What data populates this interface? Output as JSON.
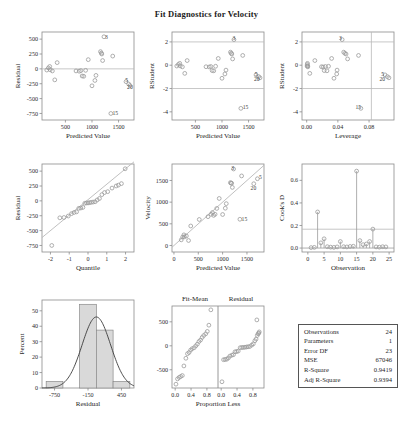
{
  "title": "Fit Diagnostics for Velocity",
  "colors": {
    "marker": "#9a9a9a",
    "axis": "#8c8c8c",
    "refline": "#b9b9b9",
    "curve": "#3b3b3b",
    "bar_fill": "#d9d9d9",
    "bar_edge": "#8a8a8a",
    "text": "#242424",
    "background": "#ffffff"
  },
  "chart_data": [
    {
      "id": "residual-vs-predicted",
      "type": "scatter",
      "title": "",
      "xlabel": "Predicted Value",
      "ylabel": "Residual",
      "xlim": [
        60,
        1790
      ],
      "ylim": [
        -860,
        620
      ],
      "xticks": [
        500,
        1000,
        1500
      ],
      "yticks": [
        -750,
        -500,
        -250,
        0,
        250,
        500
      ],
      "grid": false,
      "hline": 0,
      "points": [
        {
          "x": 150,
          "y": -20
        },
        {
          "x": 180,
          "y": 15
        },
        {
          "x": 205,
          "y": 40
        },
        {
          "x": 215,
          "y": -15
        },
        {
          "x": 255,
          "y": -35
        },
        {
          "x": 300,
          "y": -185
        },
        {
          "x": 345,
          "y": 105
        },
        {
          "x": 700,
          "y": -35
        },
        {
          "x": 760,
          "y": -40
        },
        {
          "x": 790,
          "y": -30
        },
        {
          "x": 815,
          "y": -120
        },
        {
          "x": 845,
          "y": -125
        },
        {
          "x": 880,
          "y": -25
        },
        {
          "x": 930,
          "y": 155
        },
        {
          "x": 1000,
          "y": -285
        },
        {
          "x": 1055,
          "y": -195
        },
        {
          "x": 1075,
          "y": -110
        },
        {
          "x": 1160,
          "y": 290
        },
        {
          "x": 1175,
          "y": 265
        },
        {
          "x": 1185,
          "y": 250
        },
        {
          "x": 1200,
          "y": 140
        },
        {
          "x": 1225,
          "y": 540
        },
        {
          "x": 1355,
          "y": -750
        },
        {
          "x": 1390,
          "y": 215
        },
        {
          "x": 1640,
          "y": -215
        },
        {
          "x": 1690,
          "y": -255
        },
        {
          "x": 1715,
          "y": -280
        }
      ],
      "labels": [
        {
          "x": 1245,
          "y": 540,
          "text": "3"
        },
        {
          "x": 1385,
          "y": -750,
          "text": "15"
        },
        {
          "x": 1625,
          "y": -185,
          "text": "5"
        },
        {
          "x": 1660,
          "y": -310,
          "text": "20"
        }
      ]
    },
    {
      "id": "rstudent-vs-predicted",
      "type": "scatter",
      "title": "",
      "xlabel": "Predicted Value",
      "ylabel": "RStudent",
      "xlim": [
        60,
        1790
      ],
      "ylim": [
        -4.7,
        2.85
      ],
      "xticks": [
        500,
        1000,
        1500
      ],
      "yticks": [
        -4,
        -2,
        0,
        2
      ],
      "grid": false,
      "hlines": [
        -2,
        2
      ],
      "points": [
        {
          "x": 150,
          "y": -0.07
        },
        {
          "x": 180,
          "y": 0.06
        },
        {
          "x": 205,
          "y": 0.16
        },
        {
          "x": 215,
          "y": -0.06
        },
        {
          "x": 255,
          "y": -0.14
        },
        {
          "x": 300,
          "y": -0.7
        },
        {
          "x": 345,
          "y": 0.4
        },
        {
          "x": 700,
          "y": -0.13
        },
        {
          "x": 760,
          "y": -0.15
        },
        {
          "x": 790,
          "y": -0.11
        },
        {
          "x": 815,
          "y": -0.46
        },
        {
          "x": 845,
          "y": -0.48
        },
        {
          "x": 880,
          "y": -0.09
        },
        {
          "x": 930,
          "y": 0.58
        },
        {
          "x": 1000,
          "y": -1.12
        },
        {
          "x": 1055,
          "y": -0.75
        },
        {
          "x": 1075,
          "y": -0.42
        },
        {
          "x": 1160,
          "y": 1.12
        },
        {
          "x": 1175,
          "y": 1.02
        },
        {
          "x": 1185,
          "y": 0.96
        },
        {
          "x": 1200,
          "y": 0.54
        },
        {
          "x": 1225,
          "y": 2.2
        },
        {
          "x": 1355,
          "y": -3.7
        },
        {
          "x": 1390,
          "y": 0.84
        },
        {
          "x": 1640,
          "y": -0.83
        },
        {
          "x": 1690,
          "y": -0.98
        },
        {
          "x": 1715,
          "y": -1.08
        }
      ],
      "labels": [
        {
          "x": 1200,
          "y": 2.35,
          "text": "3"
        },
        {
          "x": 1390,
          "y": -3.6,
          "text": "15"
        },
        {
          "x": 1615,
          "y": -0.72,
          "text": "5"
        },
        {
          "x": 1600,
          "y": -1.2,
          "text": "20"
        }
      ]
    },
    {
      "id": "rstudent-vs-leverage",
      "type": "scatter",
      "title": "",
      "xlabel": "Leverage",
      "ylabel": "RStudent",
      "xlim": [
        -0.006,
        0.112
      ],
      "ylim": [
        -4.7,
        2.85
      ],
      "xticks": [
        0.0,
        0.04,
        0.08
      ],
      "yticks": [
        -4,
        -2,
        0,
        2
      ],
      "grid": false,
      "hlines": [
        -2,
        2
      ],
      "vline": 0.083,
      "points": [
        {
          "x": 0.0005,
          "y": -0.07
        },
        {
          "x": 0.0008,
          "y": 0.06
        },
        {
          "x": 0.001,
          "y": 0.16
        },
        {
          "x": 0.0012,
          "y": -0.06
        },
        {
          "x": 0.0015,
          "y": -0.14
        },
        {
          "x": 0.004,
          "y": -0.7
        },
        {
          "x": 0.0105,
          "y": 0.4
        },
        {
          "x": 0.019,
          "y": -0.13
        },
        {
          "x": 0.021,
          "y": -0.15
        },
        {
          "x": 0.024,
          "y": -0.11
        },
        {
          "x": 0.0225,
          "y": -0.46
        },
        {
          "x": 0.026,
          "y": -0.48
        },
        {
          "x": 0.028,
          "y": -0.09
        },
        {
          "x": 0.032,
          "y": 0.58
        },
        {
          "x": 0.035,
          "y": -1.12
        },
        {
          "x": 0.0385,
          "y": -0.75
        },
        {
          "x": 0.039,
          "y": -0.42
        },
        {
          "x": 0.0475,
          "y": 1.12
        },
        {
          "x": 0.049,
          "y": 1.02
        },
        {
          "x": 0.0505,
          "y": 0.96
        },
        {
          "x": 0.0525,
          "y": 0.54
        },
        {
          "x": 0.0455,
          "y": 2.2
        },
        {
          "x": 0.0695,
          "y": -3.7
        },
        {
          "x": 0.0665,
          "y": 0.84
        },
        {
          "x": 0.1005,
          "y": -0.83
        },
        {
          "x": 0.1035,
          "y": -0.98
        },
        {
          "x": 0.1055,
          "y": -1.08
        }
      ],
      "labels": [
        {
          "x": 0.0415,
          "y": 2.35,
          "text": "3"
        },
        {
          "x": 0.0625,
          "y": -3.58,
          "text": "15"
        },
        {
          "x": 0.0955,
          "y": -0.72,
          "text": "5"
        },
        {
          "x": 0.0935,
          "y": -1.2,
          "text": "20"
        }
      ]
    },
    {
      "id": "residual-qq",
      "type": "scatter",
      "title": "",
      "xlabel": "Quantile",
      "ylabel": "Residual",
      "xlim": [
        -2.45,
        2.45
      ],
      "ylim": [
        -860,
        620
      ],
      "xticks": [
        -2,
        -1,
        0,
        1,
        2
      ],
      "yticks": [
        -750,
        -500,
        -250,
        0,
        250,
        500
      ],
      "grid": false,
      "refline": {
        "type": "diagonal",
        "slope": 260,
        "intercept": 20
      },
      "points": [
        {
          "x": -1.93,
          "y": -750
        },
        {
          "x": -1.5,
          "y": -285
        },
        {
          "x": -1.28,
          "y": -280
        },
        {
          "x": -1.05,
          "y": -255
        },
        {
          "x": -0.88,
          "y": -215
        },
        {
          "x": -0.74,
          "y": -195
        },
        {
          "x": -0.61,
          "y": -185
        },
        {
          "x": -0.49,
          "y": -125
        },
        {
          "x": -0.38,
          "y": -120
        },
        {
          "x": -0.27,
          "y": -110
        },
        {
          "x": -0.17,
          "y": -40
        },
        {
          "x": -0.08,
          "y": -35
        },
        {
          "x": 0.0,
          "y": -35
        },
        {
          "x": 0.08,
          "y": -30
        },
        {
          "x": 0.17,
          "y": -25
        },
        {
          "x": 0.27,
          "y": -20
        },
        {
          "x": 0.38,
          "y": -15
        },
        {
          "x": 0.49,
          "y": 15
        },
        {
          "x": 0.61,
          "y": 40
        },
        {
          "x": 0.74,
          "y": 105
        },
        {
          "x": 0.88,
          "y": 140
        },
        {
          "x": 1.05,
          "y": 155
        },
        {
          "x": 1.28,
          "y": 215
        },
        {
          "x": 1.5,
          "y": 250
        },
        {
          "x": 1.62,
          "y": 265
        },
        {
          "x": 1.78,
          "y": 290
        },
        {
          "x": 1.98,
          "y": 540
        }
      ],
      "labels": []
    },
    {
      "id": "velocity-vs-predicted",
      "type": "scatter",
      "title": "",
      "xlabel": "Predicted Value",
      "ylabel": "Velocity",
      "xlim": [
        -40,
        1850
      ],
      "ylim": [
        -150,
        1880
      ],
      "xticks": [
        0,
        500,
        1000,
        1500
      ],
      "yticks": [
        0,
        500,
        1000,
        1500
      ],
      "grid": false,
      "refline": {
        "type": "identity"
      },
      "points": [
        {
          "x": 150,
          "y": 130
        },
        {
          "x": 180,
          "y": 195
        },
        {
          "x": 205,
          "y": 245
        },
        {
          "x": 215,
          "y": 200
        },
        {
          "x": 255,
          "y": 220
        },
        {
          "x": 300,
          "y": 115
        },
        {
          "x": 345,
          "y": 450
        },
        {
          "x": 520,
          "y": 600
        },
        {
          "x": 700,
          "y": 665
        },
        {
          "x": 760,
          "y": 720
        },
        {
          "x": 790,
          "y": 760
        },
        {
          "x": 815,
          "y": 695
        },
        {
          "x": 845,
          "y": 720
        },
        {
          "x": 880,
          "y": 855
        },
        {
          "x": 930,
          "y": 1085
        },
        {
          "x": 1000,
          "y": 715
        },
        {
          "x": 1055,
          "y": 860
        },
        {
          "x": 1075,
          "y": 965
        },
        {
          "x": 1160,
          "y": 1450
        },
        {
          "x": 1175,
          "y": 1440
        },
        {
          "x": 1185,
          "y": 1435
        },
        {
          "x": 1200,
          "y": 1340
        },
        {
          "x": 1225,
          "y": 1765
        },
        {
          "x": 1355,
          "y": 605
        },
        {
          "x": 1390,
          "y": 1605
        },
        {
          "x": 1640,
          "y": 1425
        },
        {
          "x": 1715,
          "y": 1540
        }
      ],
      "labels": [
        {
          "x": 1175,
          "y": 1790,
          "text": "3"
        },
        {
          "x": 1390,
          "y": 620,
          "text": "15"
        },
        {
          "x": 1745,
          "y": 1575,
          "text": "5"
        },
        {
          "x": 1575,
          "y": 1330,
          "text": "20"
        }
      ]
    },
    {
      "id": "cooks-d",
      "type": "bar",
      "title": "",
      "xlabel": "Observation",
      "ylabel": "Cook's D",
      "xlim": [
        -1.8,
        26.5
      ],
      "ylim": [
        -0.035,
        0.745
      ],
      "xticks": [
        0,
        5,
        10,
        15,
        20,
        25
      ],
      "yticks": [
        0.0,
        0.2,
        0.4,
        0.6
      ],
      "grid": false,
      "hline": 0.167,
      "categories": [
        1,
        2,
        3,
        4,
        5,
        6,
        7,
        8,
        9,
        10,
        11,
        12,
        13,
        14,
        15,
        16,
        17,
        18,
        19,
        20,
        21,
        22,
        23,
        24
      ],
      "values": [
        0.004,
        0.006,
        0.32,
        0.046,
        0.082,
        0.012,
        0.008,
        0.006,
        0.01,
        0.058,
        0.012,
        0.01,
        0.014,
        0.016,
        0.682,
        0.066,
        0.03,
        0.036,
        0.058,
        0.168,
        0.01,
        0.008,
        0.012,
        0.01
      ]
    },
    {
      "id": "residual-histogram",
      "type": "bar",
      "title": "",
      "xlabel": "Residual",
      "ylabel": "Percent",
      "xlim": [
        -975,
        675
      ],
      "ylim": [
        0,
        57
      ],
      "xticks": [
        -750,
        -150,
        450
      ],
      "yticks": [
        0,
        10,
        20,
        30,
        40,
        50
      ],
      "grid": false,
      "bins": [
        {
          "left": -900,
          "right": -600,
          "value": 4.2
        },
        {
          "left": -600,
          "right": -300,
          "value": 0
        },
        {
          "left": -300,
          "right": 0,
          "value": 54.2
        },
        {
          "left": 0,
          "right": 300,
          "value": 37.5
        },
        {
          "left": 300,
          "right": 600,
          "value": 4.2
        }
      ],
      "normal_curve": {
        "mean": 0,
        "sd": 256,
        "peak": 46
      }
    },
    {
      "id": "rf-plot",
      "type": "scatter",
      "title": "",
      "xlabel": "Proportion Less",
      "ylabel": "",
      "panel_titles": [
        "Fit-Mean",
        "Residual"
      ],
      "xlim": [
        -0.08,
        1.08
      ],
      "ylim": [
        -880,
        830
      ],
      "xticks": [
        0.0,
        0.4,
        0.8
      ],
      "yticks": [
        -500,
        0,
        500
      ],
      "grid": false,
      "fit_mean": [
        {
          "x": 0.02,
          "y": -800
        },
        {
          "x": 0.06,
          "y": -690
        },
        {
          "x": 0.1,
          "y": -660
        },
        {
          "x": 0.14,
          "y": -640
        },
        {
          "x": 0.18,
          "y": -620
        },
        {
          "x": 0.22,
          "y": -420
        },
        {
          "x": 0.27,
          "y": -260
        },
        {
          "x": 0.31,
          "y": -165
        },
        {
          "x": 0.35,
          "y": -140
        },
        {
          "x": 0.39,
          "y": -90
        },
        {
          "x": 0.43,
          "y": -60
        },
        {
          "x": 0.48,
          "y": -40
        },
        {
          "x": 0.52,
          "y": 0
        },
        {
          "x": 0.56,
          "y": 35
        },
        {
          "x": 0.6,
          "y": 90
        },
        {
          "x": 0.64,
          "y": 120
        },
        {
          "x": 0.68,
          "y": 175
        },
        {
          "x": 0.72,
          "y": 215
        },
        {
          "x": 0.77,
          "y": 250
        },
        {
          "x": 0.81,
          "y": 300
        },
        {
          "x": 0.85,
          "y": 430
        },
        {
          "x": 0.9,
          "y": 750
        }
      ],
      "residual": [
        {
          "x": 0.02,
          "y": -750
        },
        {
          "x": 0.06,
          "y": -290
        },
        {
          "x": 0.1,
          "y": -285
        },
        {
          "x": 0.14,
          "y": -280
        },
        {
          "x": 0.18,
          "y": -255
        },
        {
          "x": 0.22,
          "y": -215
        },
        {
          "x": 0.27,
          "y": -195
        },
        {
          "x": 0.31,
          "y": -185
        },
        {
          "x": 0.35,
          "y": -125
        },
        {
          "x": 0.39,
          "y": -120
        },
        {
          "x": 0.43,
          "y": -110
        },
        {
          "x": 0.48,
          "y": -40
        },
        {
          "x": 0.52,
          "y": -35
        },
        {
          "x": 0.56,
          "y": -35
        },
        {
          "x": 0.6,
          "y": -30
        },
        {
          "x": 0.64,
          "y": -25
        },
        {
          "x": 0.68,
          "y": -20
        },
        {
          "x": 0.72,
          "y": -15
        },
        {
          "x": 0.77,
          "y": 15
        },
        {
          "x": 0.81,
          "y": 40
        },
        {
          "x": 0.85,
          "y": 105
        },
        {
          "x": 0.88,
          "y": 140
        },
        {
          "x": 0.91,
          "y": 215
        },
        {
          "x": 0.93,
          "y": 250
        },
        {
          "x": 0.95,
          "y": 265
        },
        {
          "x": 0.96,
          "y": 290
        },
        {
          "x": 0.9,
          "y": 540
        }
      ]
    }
  ],
  "stats_table": {
    "rows": [
      {
        "label": "Observations",
        "value": "24"
      },
      {
        "label": "Parameters",
        "value": "1"
      },
      {
        "label": "Error DF",
        "value": "23"
      },
      {
        "label": "MSE",
        "value": "67046"
      },
      {
        "label": "R-Square",
        "value": "0.9419"
      },
      {
        "label": "Adj R-Square",
        "value": "0.9394"
      }
    ]
  }
}
